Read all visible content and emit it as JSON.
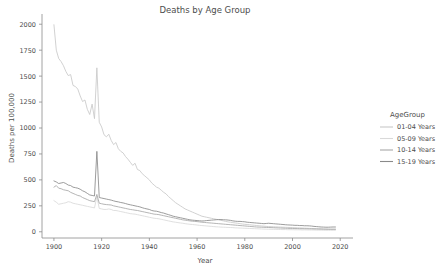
{
  "chart_data": {
    "type": "line",
    "title": "Deaths by Age Group",
    "xlabel": "Year",
    "ylabel": "Deaths per 100,000",
    "xlim": [
      1895,
      2022
    ],
    "ylim": [
      -60,
      2060
    ],
    "xticks": [
      1900,
      1920,
      1940,
      1960,
      1980,
      2000,
      2020
    ],
    "yticks": [
      0,
      250,
      500,
      750,
      1000,
      1250,
      1500,
      1750,
      2000
    ],
    "grid": false,
    "legend_title": "AgeGroup",
    "legend_position": "right",
    "x": [
      1900,
      1901,
      1902,
      1903,
      1904,
      1905,
      1906,
      1907,
      1908,
      1909,
      1910,
      1911,
      1912,
      1913,
      1914,
      1915,
      1916,
      1917,
      1918,
      1919,
      1920,
      1921,
      1922,
      1923,
      1924,
      1925,
      1926,
      1927,
      1928,
      1929,
      1930,
      1931,
      1932,
      1933,
      1934,
      1935,
      1936,
      1937,
      1938,
      1939,
      1940,
      1941,
      1942,
      1943,
      1944,
      1945,
      1946,
      1947,
      1948,
      1949,
      1950,
      1951,
      1952,
      1953,
      1954,
      1955,
      1956,
      1957,
      1958,
      1959,
      1960,
      1961,
      1962,
      1963,
      1964,
      1965,
      1966,
      1967,
      1968,
      1969,
      1970,
      1971,
      1972,
      1973,
      1974,
      1975,
      1976,
      1977,
      1978,
      1979,
      1980,
      1981,
      1982,
      1983,
      1984,
      1985,
      1986,
      1987,
      1988,
      1989,
      1990,
      1991,
      1992,
      1993,
      1994,
      1995,
      1996,
      1997,
      1998,
      1999,
      2000,
      2001,
      2002,
      2003,
      2004,
      2005,
      2006,
      2007,
      2008,
      2009,
      2010,
      2011,
      2012,
      2013,
      2014,
      2015,
      2016,
      2017,
      2018
    ],
    "series": [
      {
        "name": "01-04 Years",
        "color": "#c9c9c9",
        "values": [
          1995,
          1750,
          1670,
          1640,
          1600,
          1545,
          1505,
          1515,
          1410,
          1400,
          1375,
          1310,
          1255,
          1270,
          1180,
          1130,
          1230,
          1090,
          1580,
          1055,
          1010,
          935,
          915,
          940,
          880,
          840,
          860,
          800,
          775,
          760,
          725,
          700,
          670,
          640,
          660,
          600,
          590,
          560,
          540,
          520,
          500,
          470,
          450,
          430,
          420,
          400,
          380,
          365,
          340,
          320,
          300,
          280,
          265,
          250,
          235,
          220,
          210,
          200,
          190,
          180,
          170,
          160,
          150,
          145,
          140,
          135,
          130,
          125,
          120,
          115,
          110,
          105,
          100,
          95,
          92,
          88,
          85,
          82,
          78,
          75,
          72,
          70,
          68,
          65,
          63,
          60,
          58,
          56,
          54,
          52,
          50,
          49,
          48,
          47,
          46,
          45,
          44,
          43,
          42,
          41,
          40,
          39,
          38,
          37,
          36,
          35,
          34,
          33,
          32,
          31,
          30,
          29,
          28,
          27,
          26,
          26,
          25,
          25,
          25
        ]
      },
      {
        "name": "05-09 Years",
        "color": "#d9d9d9",
        "values": [
          300,
          285,
          265,
          270,
          275,
          280,
          290,
          285,
          275,
          270,
          265,
          260,
          255,
          250,
          245,
          240,
          235,
          230,
          340,
          225,
          220,
          215,
          215,
          220,
          215,
          205,
          205,
          200,
          195,
          190,
          185,
          180,
          175,
          172,
          170,
          165,
          160,
          155,
          150,
          145,
          140,
          135,
          130,
          128,
          125,
          120,
          115,
          110,
          105,
          100,
          95,
          92,
          88,
          85,
          82,
          78,
          75,
          72,
          70,
          68,
          65,
          62,
          60,
          58,
          56,
          54,
          52,
          50,
          48,
          47,
          45,
          44,
          43,
          42,
          41,
          40,
          38,
          37,
          36,
          35,
          34,
          33,
          32,
          31,
          30,
          29,
          28,
          27,
          26,
          25,
          24,
          24,
          23,
          23,
          22,
          22,
          21,
          21,
          20,
          20,
          20,
          19,
          19,
          19,
          18,
          18,
          18,
          17,
          17,
          17,
          16,
          16,
          16,
          15,
          15,
          15,
          15,
          15,
          15
        ]
      },
      {
        "name": "10-14 Years",
        "color": "#a8a8a8",
        "values": [
          430,
          445,
          420,
          415,
          405,
          400,
          395,
          380,
          370,
          360,
          350,
          345,
          330,
          320,
          310,
          300,
          295,
          290,
          360,
          275,
          270,
          265,
          262,
          260,
          258,
          250,
          245,
          240,
          235,
          230,
          225,
          220,
          215,
          212,
          208,
          205,
          200,
          195,
          190,
          185,
          180,
          175,
          170,
          168,
          165,
          160,
          155,
          150,
          145,
          140,
          135,
          130,
          125,
          120,
          115,
          112,
          108,
          105,
          102,
          100,
          98,
          95,
          92,
          90,
          88,
          86,
          84,
          82,
          80,
          78,
          76,
          74,
          72,
          70,
          68,
          66,
          64,
          62,
          60,
          58,
          56,
          54,
          52,
          50,
          48,
          46,
          45,
          44,
          43,
          42,
          41,
          40,
          39,
          38,
          37,
          36,
          35,
          34,
          33,
          32,
          32,
          31,
          31,
          30,
          30,
          29,
          29,
          28,
          28,
          27,
          27,
          26,
          26,
          25,
          25,
          24,
          24,
          24,
          24
        ]
      },
      {
        "name": "15-19 Years",
        "color": "#8a8a8a",
        "values": [
          490,
          480,
          465,
          470,
          475,
          465,
          450,
          445,
          430,
          425,
          420,
          410,
          395,
          385,
          370,
          355,
          350,
          345,
          775,
          330,
          325,
          320,
          315,
          310,
          305,
          298,
          292,
          288,
          282,
          278,
          272,
          265,
          260,
          255,
          250,
          245,
          240,
          232,
          225,
          220,
          215,
          205,
          200,
          198,
          192,
          185,
          180,
          172,
          165,
          158,
          150,
          145,
          140,
          135,
          130,
          125,
          120,
          115,
          112,
          110,
          108,
          106,
          104,
          105,
          108,
          110,
          112,
          114,
          116,
          118,
          118,
          116,
          115,
          113,
          110,
          105,
          102,
          100,
          100,
          98,
          96,
          92,
          90,
          88,
          86,
          84,
          82,
          80,
          78,
          80,
          82,
          80,
          78,
          76,
          74,
          72,
          70,
          68,
          66,
          65,
          64,
          62,
          62,
          60,
          60,
          58,
          58,
          57,
          55,
          52,
          50,
          48,
          46,
          45,
          44,
          44,
          45,
          46,
          46
        ]
      }
    ]
  },
  "legend": {
    "title": "AgeGroup",
    "items": [
      {
        "label": "01-04 Years",
        "color": "#c9c9c9"
      },
      {
        "label": "05-09 Years",
        "color": "#d9d9d9"
      },
      {
        "label": "10-14 Years",
        "color": "#a8a8a8"
      },
      {
        "label": "15-19 Years",
        "color": "#8a8a8a"
      }
    ]
  }
}
